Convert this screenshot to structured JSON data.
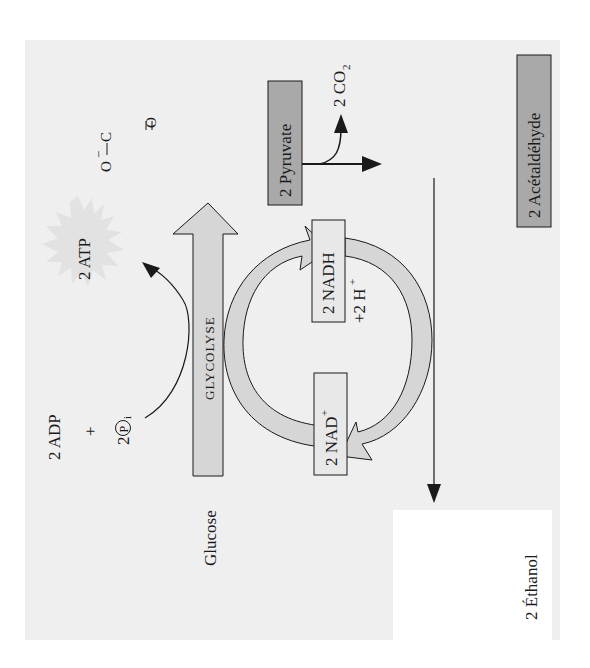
{
  "diagram": {
    "type": "metabolic-pathway",
    "orientation": "rotated-90-ccw",
    "colors": {
      "page": "#ffffff",
      "panel": "#efefef",
      "arrow_fill": "#d6d6d6",
      "dark_box": "#a9a9a9",
      "light_box": "#dedede",
      "atp_burst": "#e2e2e2",
      "line": "#1a1a1a",
      "ethanol_box": "#ffffff"
    },
    "inputs": {
      "glucose": "Glucose",
      "adp": "2 ADP",
      "plus": "+",
      "pi_coef": "2",
      "pi_symbol": "P",
      "pi_sub": "i"
    },
    "glycolysis": {
      "label": "Glycolyse"
    },
    "atp": {
      "label": "2 ATP"
    },
    "cycle": {
      "nadh": "2 NADH",
      "nad": "2 NAD",
      "nad_sup": "+",
      "protons": "+2 H",
      "protons_sup": "+"
    },
    "pyruvate": {
      "label": "2 Pyruvate",
      "structure": {
        "o_minus": "O",
        "minus": "−",
        "c1": "C",
        "c2": "C",
        "o1": "O",
        "o2": "O",
        "ch": "CH",
        "sub3": "3"
      }
    },
    "co2": {
      "label": "2 CO",
      "sub": "2"
    },
    "acetaldehyde": {
      "label": "2 Acétaldéhyde",
      "structure": {
        "h": "H",
        "c": "C",
        "o": "O",
        "ch": "CH",
        "sub3": "3"
      }
    },
    "ethanol": {
      "label": "2 Éthanol",
      "structure": {
        "h_top": "H",
        "h_left": "H",
        "c": "C",
        "oh": "OH",
        "ch": "CH",
        "sub3": "3"
      }
    }
  }
}
